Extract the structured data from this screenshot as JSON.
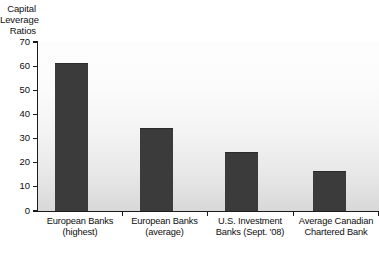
{
  "chart_data": {
    "type": "bar",
    "title": "Capital Leverage Ratios",
    "title_lines": [
      "Capital",
      "Leverage",
      "Ratios"
    ],
    "xlabel": "",
    "ylabel": "Capital Leverage Ratios",
    "ylim": [
      0,
      70
    ],
    "ytick_step": 10,
    "ytick_labels": [
      "70",
      "60",
      "50",
      "40",
      "30",
      "20",
      "10",
      "0"
    ],
    "ytick_values": [
      70,
      60,
      50,
      40,
      30,
      20,
      10,
      0
    ],
    "grid": false,
    "legend": "none",
    "bar_color": "#3b3b3b",
    "categories": [
      "European Banks (highest)",
      "European Banks (average)",
      "U.S. Investment Banks (Sept. '08)",
      "Average Canadian Chartered Bank"
    ],
    "category_lines": [
      [
        "European Banks",
        "(highest)"
      ],
      [
        "European Banks",
        "(average)"
      ],
      [
        "U.S. Investment",
        "Banks (Sept. '08)"
      ],
      [
        "Average Canadian",
        "Chartered Bank"
      ]
    ],
    "values": [
      61,
      34,
      24,
      16
    ]
  }
}
